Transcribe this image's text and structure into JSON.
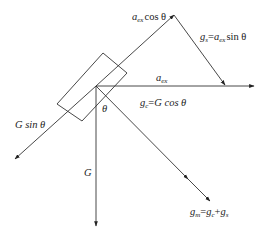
{
  "diagram": {
    "title": "",
    "colors": {
      "line": "#333333",
      "text": "#222222",
      "background": "#ffffff"
    },
    "labels": {
      "aex_cos": {
        "main": "a",
        "sub": "ex",
        "rest": "cos θ"
      },
      "gs": {
        "g": "g",
        "gsub": "s",
        "eq": "=",
        "a": "a",
        "asub": "ex",
        "rest": "sin θ"
      },
      "aex": {
        "main": "a",
        "sub": "ex"
      },
      "gc": {
        "g": "g",
        "gsub": "c",
        "eq": "=",
        "rest": "G cos θ"
      },
      "g_sin": {
        "text": "G sin θ"
      },
      "theta": {
        "text": "θ"
      },
      "G": {
        "text": "G"
      },
      "gm": {
        "g": "g",
        "gsub": "m",
        "eq": "=",
        "g1": "g",
        "g1sub": "c",
        "plus": "+",
        "g2": "g",
        "g2sub": "s"
      }
    },
    "vectors": [
      {
        "name": "aex-cos-vector",
        "from": [
          96,
          86
        ],
        "to": [
          174,
          15
        ]
      },
      {
        "name": "gs-vector",
        "from": [
          174,
          15
        ],
        "to": [
          225,
          85
        ]
      },
      {
        "name": "aex-vector",
        "from": [
          96,
          86
        ],
        "to": [
          254,
          86
        ]
      },
      {
        "name": "g-sin-vector",
        "from": [
          96,
          86
        ],
        "to": [
          15,
          159
        ]
      },
      {
        "name": "g-vector",
        "from": [
          96,
          86
        ],
        "to": [
          96,
          226
        ]
      },
      {
        "name": "gm-vector",
        "from": [
          96,
          86
        ],
        "to": [
          210,
          201
        ]
      }
    ],
    "block": {
      "corners": [
        [
          103,
          53
        ],
        [
          127,
          73
        ],
        [
          82,
          121
        ],
        [
          57,
          104
        ]
      ]
    }
  }
}
